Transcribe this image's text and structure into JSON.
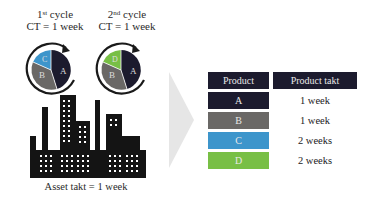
{
  "colors": {
    "A": "#1c1b2e",
    "B": "#6a6866",
    "C": "#3d95cb",
    "D": "#78bf45",
    "header": "#1c1b2e",
    "arrow": "#e6e6e6",
    "building": "#141414"
  },
  "cycles": [
    {
      "ordinal_number": "1",
      "ordinal_suffix": "st",
      "label_rest": " cycle",
      "ct_text": "CT = 1 week",
      "slices": [
        {
          "label": "A",
          "color_key": "A"
        },
        {
          "label": "B",
          "color_key": "B"
        },
        {
          "label": "C",
          "color_key": "C"
        }
      ]
    },
    {
      "ordinal_number": "2",
      "ordinal_suffix": "nd",
      "label_rest": " cycle",
      "ct_text": "CT = 1 week",
      "slices": [
        {
          "label": "A",
          "color_key": "A"
        },
        {
          "label": "B",
          "color_key": "B"
        },
        {
          "label": "D",
          "color_key": "D"
        }
      ]
    }
  ],
  "asset_caption": "Asset takt = 1 week",
  "table": {
    "headers": [
      "Product",
      "Product takt"
    ],
    "rows": [
      {
        "product": "A",
        "takt": "1 week",
        "color_key": "A"
      },
      {
        "product": "B",
        "takt": "1 week",
        "color_key": "B"
      },
      {
        "product": "C",
        "takt": "2 weeks",
        "color_key": "C"
      },
      {
        "product": "D",
        "takt": "2 weeks",
        "color_key": "D"
      }
    ]
  }
}
